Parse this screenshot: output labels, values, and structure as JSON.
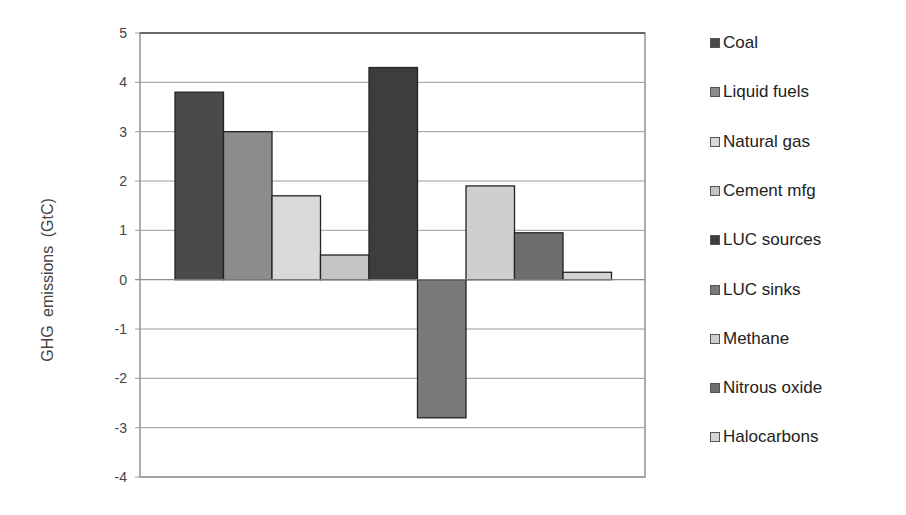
{
  "chart_data": {
    "type": "bar",
    "title": "",
    "xlabel": "",
    "ylabel": "GHG  emissions  (GtC)",
    "ylim": [
      -4,
      5
    ],
    "yticks": [
      5,
      4,
      3,
      2,
      1,
      0,
      -1,
      -2,
      -3,
      -4
    ],
    "grid": true,
    "legend_position": "right",
    "categories": [
      ""
    ],
    "series": [
      {
        "name": "Coal",
        "values": [
          3.8
        ],
        "color": "#4a4a4a"
      },
      {
        "name": "Liquid fuels",
        "values": [
          3.0
        ],
        "color": "#8c8c8c"
      },
      {
        "name": "Natural gas",
        "values": [
          1.7
        ],
        "color": "#d9d9d9"
      },
      {
        "name": "Cement mfg",
        "values": [
          0.5
        ],
        "color": "#c4c4c4"
      },
      {
        "name": "LUC sources",
        "values": [
          4.3
        ],
        "color": "#3d3d3d"
      },
      {
        "name": "LUC sinks",
        "values": [
          -2.8
        ],
        "color": "#7a7a7a"
      },
      {
        "name": "Methane",
        "values": [
          1.9
        ],
        "color": "#cfcfcf"
      },
      {
        "name": "Nitrous oxide",
        "values": [
          0.95
        ],
        "color": "#6e6e6e"
      },
      {
        "name": "Halocarbons",
        "values": [
          0.15
        ],
        "color": "#d4d4d4"
      }
    ]
  },
  "legend": {
    "items": [
      "Coal",
      "Liquid fuels",
      "Natural gas",
      "Cement mfg",
      "LUC sources",
      "LUC sinks",
      "Methane",
      "Nitrous oxide",
      "Halocarbons"
    ]
  }
}
